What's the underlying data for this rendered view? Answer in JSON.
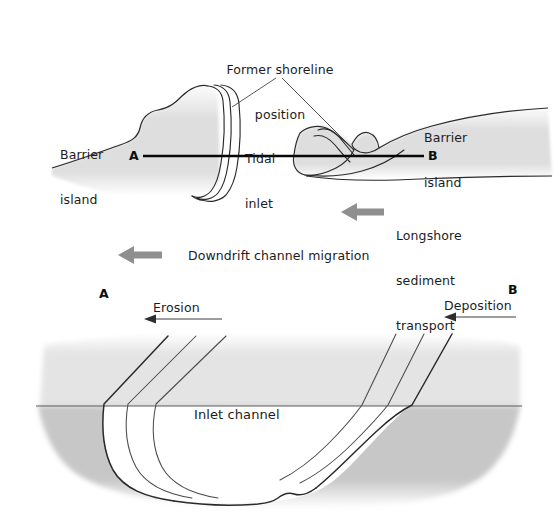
{
  "figure": {
    "background_color": "#ffffff",
    "ink_color": "#1c1c1c",
    "land_fill": "#dcdcdc",
    "land_fill_light": "#e8e8e8",
    "sediment_fill": "#c9c9c9",
    "arrow_gray": "#8d8d8d"
  },
  "map_panel": {
    "name": "map-view",
    "labels": {
      "former_shoreline": "Former shoreline\nposition",
      "former_shoreline_line1": "Former shoreline",
      "former_shoreline_line2": "position",
      "barrier_island_left_line1": "Barrier",
      "barrier_island_left_line2": "island",
      "barrier_island_right_line1": "Barrier",
      "barrier_island_right_line2": "island",
      "tidal_inlet_line1": "Tidal",
      "tidal_inlet_line2": "inlet",
      "longshore_line1": "Longshore",
      "longshore_line2": "sediment",
      "longshore_line3": "transport",
      "downdrift": "Downdrift channel migration"
    },
    "section_markers": {
      "left": "A",
      "right": "B"
    },
    "arrows": {
      "longshore_direction": "left",
      "downdrift_direction": "left"
    }
  },
  "cross_section_panel": {
    "name": "cross-section-view",
    "labels": {
      "erosion": "Erosion",
      "deposition": "Deposition",
      "inlet_channel": "Inlet channel"
    },
    "section_markers": {
      "left": "A",
      "right": "B"
    },
    "arrows": {
      "erosion_direction": "left",
      "deposition_direction": "left"
    },
    "former_positions_count": 3
  }
}
